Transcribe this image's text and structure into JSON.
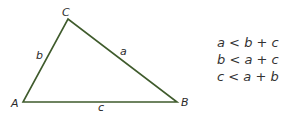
{
  "diagram": {
    "type": "triangle",
    "stroke_color": "#3f5b2c",
    "vertices": [
      {
        "name": "A",
        "x": 23,
        "y": 102,
        "label_x": 11,
        "label_y": 107
      },
      {
        "name": "B",
        "x": 177,
        "y": 102,
        "label_x": 181,
        "label_y": 106
      },
      {
        "name": "C",
        "x": 68,
        "y": 19,
        "label_x": 62,
        "label_y": 16
      }
    ],
    "sides": [
      {
        "name": "a",
        "label_x": 120,
        "label_y": 55
      },
      {
        "name": "b",
        "label_x": 36,
        "label_y": 59
      },
      {
        "name": "c",
        "label_x": 98,
        "label_y": 111
      }
    ]
  },
  "inequalities": [
    {
      "lhs": "a",
      "op": "<",
      "r1": "b",
      "plus": "+",
      "r2": "c"
    },
    {
      "lhs": "b",
      "op": "<",
      "r1": "a",
      "plus": "+",
      "r2": "c"
    },
    {
      "lhs": "c",
      "op": "<",
      "r1": "a",
      "plus": "+",
      "r2": "b"
    }
  ]
}
